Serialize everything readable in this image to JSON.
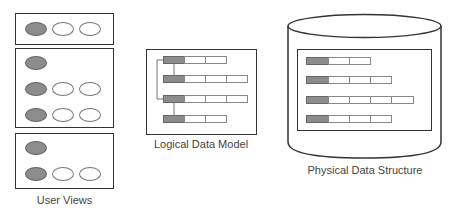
{
  "diagram": {
    "user_views": {
      "label": "User Views",
      "views": [
        {
          "rows": [
            3
          ]
        },
        {
          "rows": [
            1,
            3,
            3
          ]
        },
        {
          "rows": [
            1,
            3
          ]
        }
      ]
    },
    "logical_model": {
      "label": "Logical Data Model",
      "rows": [
        3,
        4,
        4,
        3
      ]
    },
    "physical_structure": {
      "label": "Physical Data Structure",
      "shape": "cylinder",
      "rows": [
        3,
        4,
        5,
        4
      ]
    },
    "colors": {
      "key_fill": "#8c8c8c",
      "outline": "#333333",
      "cell_border": "#888888"
    }
  }
}
